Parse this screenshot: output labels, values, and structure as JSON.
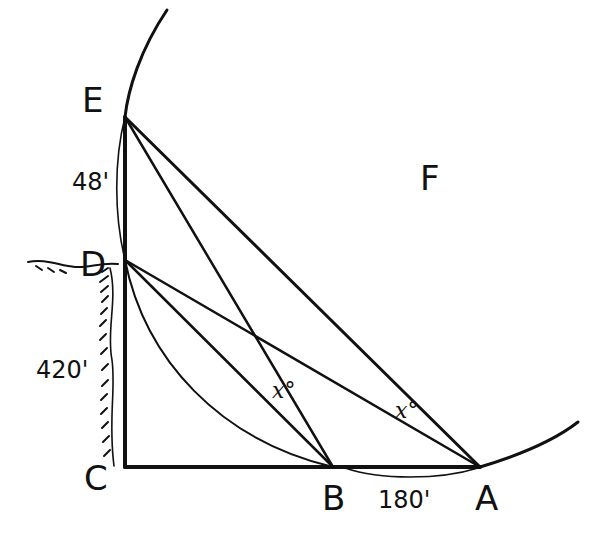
{
  "diagram": {
    "type": "geometry-construction",
    "points": {
      "E": {
        "label": "E",
        "x": 125,
        "y": 117
      },
      "D": {
        "label": "D",
        "x": 125,
        "y": 260
      },
      "C": {
        "label": "C",
        "x": 125,
        "y": 467
      },
      "B": {
        "label": "B",
        "x": 333,
        "y": 467
      },
      "A": {
        "label": "A",
        "x": 480,
        "y": 467
      },
      "F": {
        "label": "F"
      }
    },
    "measurements": {
      "ED": "48'",
      "DC": "420'",
      "BA": "180'"
    },
    "angles": {
      "angle_at_B": "x°",
      "angle_at_A": "x°"
    },
    "segments": [
      "C-E",
      "C-A",
      "E-A",
      "E-B",
      "D-A",
      "D-B"
    ],
    "arcs": [
      "large arc through E and A",
      "arc D to B",
      "arc E to D",
      "arc B to A"
    ],
    "stroke_color": "#111111",
    "hatch_note": "ground/cliff hatching along C-D and left of D"
  }
}
